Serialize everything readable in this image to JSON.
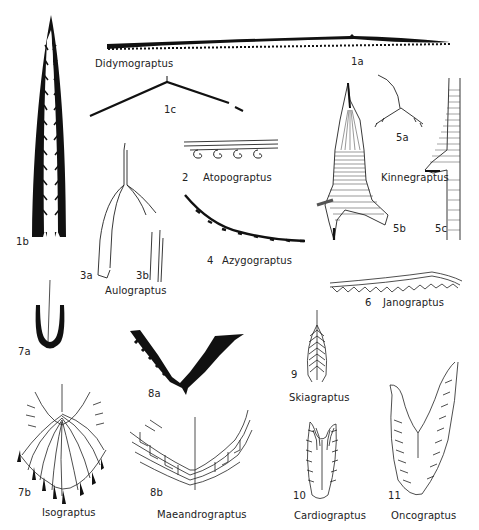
{
  "plate": {
    "title": "",
    "figures": [
      {
        "id": "1a",
        "genus": "Didymograptus"
      },
      {
        "id": "1b",
        "genus": "Didymograptus"
      },
      {
        "id": "1c",
        "genus": "Didymograptus"
      },
      {
        "id": "2",
        "genus": "Atopograptus"
      },
      {
        "id": "3a",
        "genus": "Aulograptus"
      },
      {
        "id": "3b",
        "genus": "Aulograptus"
      },
      {
        "id": "4",
        "genus": "Azygograptus"
      },
      {
        "id": "5a",
        "genus": "Kinnegraptus"
      },
      {
        "id": "5b",
        "genus": "Kinnegraptus"
      },
      {
        "id": "5c",
        "genus": "Kinnegraptus"
      },
      {
        "id": "6",
        "genus": "Janograptus"
      },
      {
        "id": "7a",
        "genus": "Isograptus"
      },
      {
        "id": "7b",
        "genus": "Isograptus"
      },
      {
        "id": "8a",
        "genus": "Maeandrograptus"
      },
      {
        "id": "8b",
        "genus": "Maeandrograptus"
      },
      {
        "id": "9",
        "genus": "Skiagraptus"
      },
      {
        "id": "10",
        "genus": "Cardiograptus"
      },
      {
        "id": "11",
        "genus": "Oncograptus"
      }
    ]
  },
  "labels": {
    "didymograptus": "Didymograptus",
    "fig_1a": "1a",
    "fig_1b": "1b",
    "fig_1c": "1c",
    "atopograptus": "Atopograptus",
    "fig_2": "2",
    "aulograptus": "Aulograptus",
    "fig_3a": "3a",
    "fig_3b": "3b",
    "azygograptus": "Azygograptus",
    "fig_4": "4",
    "kinnegraptus": "Kinnegraptus",
    "fig_5a": "5a",
    "fig_5b": "5b",
    "fig_5c": "5c",
    "janograptus": "Janograptus",
    "fig_6": "6",
    "fig_7a": "7a",
    "fig_7b": "7b",
    "isograptus": "Isograptus",
    "fig_8a": "8a",
    "fig_8b": "8b",
    "maeandrograptus": "Maeandrograptus",
    "fig_9": "9",
    "skiagraptus": "Skiagraptus",
    "fig_10": "10",
    "cardiograptus": "Cardiograptus",
    "fig_11": "11",
    "oncograptus": "Oncograptus"
  },
  "colors": {
    "ink": "#111111",
    "background": "#ffffff"
  }
}
